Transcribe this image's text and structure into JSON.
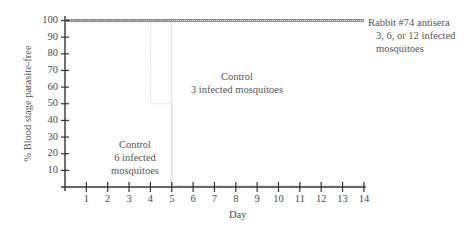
{
  "chart_data": {
    "type": "line",
    "title": "",
    "xlabel": "Day",
    "ylabel": "% Blood stage parasite-free",
    "x_ticks": [
      1,
      2,
      3,
      4,
      5,
      6,
      7,
      8,
      9,
      10,
      11,
      12,
      13,
      14
    ],
    "y_ticks": [
      10,
      20,
      30,
      40,
      50,
      60,
      70,
      80,
      90,
      100
    ],
    "xlim": [
      0,
      14
    ],
    "ylim": [
      0,
      100
    ],
    "grid": false,
    "legend": "inline annotations",
    "series": [
      {
        "name": "Rabbit #74 antisera 3, 6, or 12 infected mosquitoes",
        "x": [
          0,
          14
        ],
        "y": [
          100,
          100
        ],
        "style": "textured"
      },
      {
        "name": "Control 3 infected mosquitoes",
        "x": [
          0,
          5,
          5,
          14
        ],
        "y": [
          100,
          100,
          0,
          0
        ],
        "style": "thin-light"
      },
      {
        "name": "Control 6 infected mosquitoes",
        "x": [
          0,
          4,
          4,
          5,
          5,
          14
        ],
        "y": [
          100,
          100,
          50,
          50,
          0,
          0
        ],
        "style": "thin-light-dotted"
      }
    ],
    "annotations": [
      {
        "text": [
          "Rabbit #74 antisera",
          "3, 6, or 12 infected",
          "mosquitoes"
        ],
        "x": 14,
        "y": 100
      },
      {
        "text": [
          "Control",
          "3 infected mosquitoes"
        ],
        "x": 6.5,
        "y": 70
      },
      {
        "text": [
          "Control",
          "6 infected",
          "mosquitoes"
        ],
        "x": 3,
        "y": 20
      }
    ]
  },
  "axis": {
    "ylabel": "% Blood stage parasite-free",
    "xlabel": "Day",
    "y_tick_labels": [
      "100",
      "90",
      "80",
      "70",
      "60",
      "50",
      "40",
      "30",
      "20",
      "10"
    ],
    "x_tick_labels": [
      "1",
      "2",
      "3",
      "4",
      "5",
      "6",
      "7",
      "8",
      "9",
      "10",
      "11",
      "12",
      "13",
      "14"
    ]
  },
  "annotations": {
    "rabbit": [
      "Rabbit #74 antisera",
      "3, 6, or 12 infected",
      "mosquitoes"
    ],
    "control3": [
      "Control",
      "3 infected mosquitoes"
    ],
    "control6": [
      "Control",
      "6 infected",
      "mosquitoes"
    ]
  },
  "colors": {
    "axis": "#333333",
    "rabbit_line": "#8a8a8a",
    "control_line": "#d8d8d8",
    "text": "#4a4a4a"
  }
}
